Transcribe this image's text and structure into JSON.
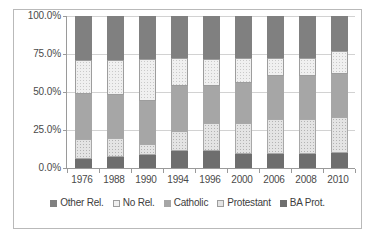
{
  "chart_data": {
    "type": "bar",
    "subtype": "stacked-percentage",
    "title": "",
    "xlabel": "",
    "ylabel": "",
    "ylim": [
      0,
      100
    ],
    "ytick_labels": [
      "0.0%",
      "25.0%",
      "50.0%",
      "75.0%",
      "100.0%"
    ],
    "ytick_values": [
      0,
      25,
      50,
      75,
      100
    ],
    "grid": true,
    "legend_position": "bottom",
    "categories": [
      "1976",
      "1988",
      "1990",
      "1994",
      "1996",
      "2000",
      "2006",
      "2008",
      "2010"
    ],
    "series": [
      {
        "name": "BA Prot.",
        "color": "#6e6e6e",
        "values": [
          6.0,
          7.5,
          8.5,
          11.5,
          11.0,
          9.5,
          9.5,
          9.0,
          10.0
        ]
      },
      {
        "name": "Protestant",
        "color": "#e4e4e4",
        "values": [
          13.0,
          12.5,
          7.5,
          13.0,
          18.5,
          20.0,
          22.5,
          23.5,
          23.5
        ]
      },
      {
        "name": "Catholic",
        "color": "#a6a6a6",
        "values": [
          30.0,
          28.0,
          28.0,
          29.5,
          24.5,
          26.5,
          28.5,
          28.0,
          28.5
        ]
      },
      {
        "name": "No Rel.",
        "color": "#f0f0f0",
        "values": [
          22.0,
          23.0,
          28.0,
          18.5,
          18.0,
          16.5,
          12.0,
          12.0,
          15.0
        ]
      },
      {
        "name": "Other Rel.",
        "color": "#808080",
        "values": [
          29.0,
          29.0,
          28.0,
          27.5,
          28.0,
          27.5,
          27.5,
          27.5,
          23.0
        ]
      }
    ],
    "stack_order_bottom_to_top": [
      "BA Prot.",
      "Protestant",
      "Catholic",
      "No Rel.",
      "Other Rel."
    ],
    "legend_entries": [
      {
        "label": "Other Rel.",
        "color": "#808080",
        "icon": "filled-square"
      },
      {
        "label": "No Rel.",
        "color": "#f0f0f0",
        "icon": "outlined-square"
      },
      {
        "label": "Catholic",
        "color": "#a6a6a6",
        "icon": "filled-square"
      },
      {
        "label": "Protestant",
        "color": "#e4e4e4",
        "icon": "outlined-square"
      },
      {
        "label": "BA Prot.",
        "color": "#6e6e6e",
        "icon": "filled-square"
      }
    ]
  }
}
